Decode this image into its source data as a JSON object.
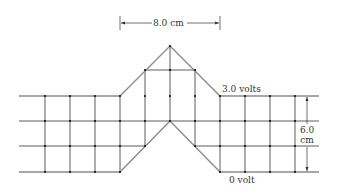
{
  "diagram": {
    "type": "field-line / equipotential grid",
    "dimension_top": "8.0 cm",
    "dimension_right_line1": "6.0",
    "dimension_right_line2": "cm",
    "upper_conductor_label": "3.0 volts",
    "lower_conductor_label": "0 volt"
  },
  "colors": {
    "conductor": "#8a8a8a",
    "grid": "#333333",
    "node": "#111111",
    "text": "#333333"
  }
}
